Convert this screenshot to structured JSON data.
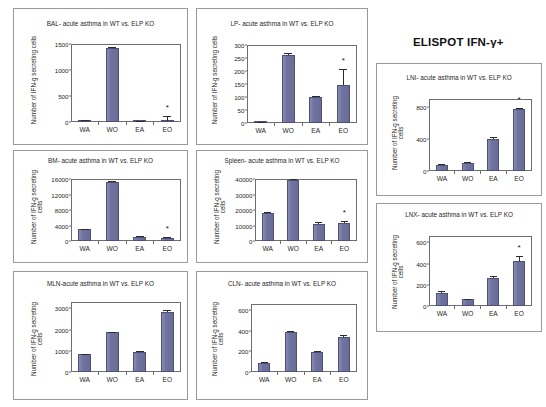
{
  "figure": {
    "main_title": "ELISPOT IFN-γ+",
    "background_color": "#ffffff",
    "bar_color": "#6f739f",
    "bar_edge_color": "#4d5178",
    "significance_marker": "*"
  },
  "chart_data": [
    {
      "id": "bal",
      "type": "bar",
      "title": "BAL- acute asthma in WT vs. ELP KO",
      "ylabel": "Number of IFN-g secreting cells",
      "xlabel": "",
      "categories": [
        "WA",
        "WO",
        "EA",
        "EO"
      ],
      "values": [
        35,
        1420,
        15,
        25
      ],
      "errors": [
        12,
        18,
        6,
        95
      ],
      "ylim": [
        0,
        1500
      ],
      "yticks": [
        0,
        500,
        1000,
        1500
      ],
      "ytick_labels": [
        "0",
        "500",
        "1000",
        "1500"
      ],
      "significance": [
        false,
        false,
        false,
        true
      ],
      "grid": false,
      "legend": "none"
    },
    {
      "id": "lp",
      "type": "bar",
      "title": "LP- acute asthma in WT vs. ELP KO",
      "ylabel": "Number of IFN-g secreting cells",
      "xlabel": "",
      "categories": [
        "WA",
        "WO",
        "EA",
        "EO"
      ],
      "values": [
        3,
        262,
        100,
        148
      ],
      "errors": [
        2,
        6,
        3,
        58
      ],
      "ylim": [
        0,
        300
      ],
      "yticks": [
        0,
        50,
        100,
        150,
        200,
        250,
        300
      ],
      "ytick_labels": [
        "0",
        "50",
        "100",
        "150",
        "200",
        "250",
        "300"
      ],
      "significance": [
        false,
        false,
        false,
        true
      ],
      "grid": false,
      "legend": "none"
    },
    {
      "id": "lni",
      "type": "bar",
      "title": "LNI- acute asthma in WT vs. ELP KO",
      "ylabel": "Number of IFN-g secreting cells",
      "xlabel": "",
      "categories": [
        "WA",
        "WO",
        "EA",
        "EO"
      ],
      "values": [
        75,
        105,
        405,
        775
      ],
      "errors": [
        8,
        8,
        18,
        16
      ],
      "ylim": [
        0,
        900
      ],
      "yticks": [
        0,
        400,
        800
      ],
      "ytick_labels": [
        "0",
        "400",
        "800"
      ],
      "significance": [
        false,
        false,
        false,
        true
      ],
      "grid": false,
      "legend": "none"
    },
    {
      "id": "bm",
      "type": "bar",
      "title": "BM- acute asthma in WT vs. ELP KO",
      "ylabel": "Number of IFN-g secreting cells",
      "xlabel": "",
      "categories": [
        "WA",
        "WO",
        "EA",
        "EO"
      ],
      "values": [
        3050,
        15300,
        1150,
        850
      ],
      "errors": [
        90,
        120,
        220,
        260
      ],
      "ylim": [
        0,
        16000
      ],
      "yticks": [
        0,
        4000,
        8000,
        12000,
        16000
      ],
      "ytick_labels": [
        "0",
        "4000",
        "8000",
        "12000",
        "16000"
      ],
      "significance": [
        false,
        false,
        false,
        true
      ],
      "grid": false,
      "legend": "none"
    },
    {
      "id": "spleen",
      "type": "bar",
      "title": "Spleen- acute asthma in WT vs. ELP KO",
      "ylabel": "Number of IFN-g secreting cells",
      "xlabel": "",
      "categories": [
        "WA",
        "WO",
        "EA",
        "EO"
      ],
      "values": [
        18300,
        39600,
        11200,
        11400
      ],
      "errors": [
        400,
        250,
        1300,
        1600
      ],
      "ylim": [
        0,
        40000
      ],
      "yticks": [
        0,
        10000,
        20000,
        30000,
        40000
      ],
      "ytick_labels": [
        "0",
        "10000",
        "20000",
        "30000",
        "40000"
      ],
      "significance": [
        false,
        false,
        false,
        true
      ],
      "grid": false,
      "legend": "none"
    },
    {
      "id": "lnx",
      "type": "bar",
      "title": "LNX- acute asthma in WT vs. ELP KO",
      "ylabel": "Number of IFN-g secreting cells",
      "xlabel": "",
      "categories": [
        "WA",
        "WO",
        "EA",
        "EO"
      ],
      "values": [
        120,
        62,
        265,
        425
      ],
      "errors": [
        20,
        6,
        15,
        45
      ],
      "ylim": [
        0,
        660
      ],
      "yticks": [
        0,
        200,
        400,
        600
      ],
      "ytick_labels": [
        "0",
        "200",
        "400",
        "600"
      ],
      "significance": [
        false,
        false,
        false,
        true
      ],
      "grid": false,
      "legend": "none"
    },
    {
      "id": "mln",
      "type": "bar",
      "title": "MLN-acute asthma in WT vs. ELP KO",
      "ylabel": "Number of IFN-g secreting cells",
      "xlabel": "",
      "categories": [
        "WA",
        "WO",
        "EA",
        "EO"
      ],
      "values": [
        850,
        1870,
        960,
        2850
      ],
      "errors": [
        10,
        12,
        20,
        95
      ],
      "ylim": [
        0,
        3300
      ],
      "yticks": [
        0,
        1000,
        2000,
        3000
      ],
      "ytick_labels": [
        "0",
        "1000",
        "2000",
        "3000"
      ],
      "significance": [
        false,
        false,
        false,
        false
      ],
      "grid": false,
      "legend": "none"
    },
    {
      "id": "cln",
      "type": "bar",
      "title": "CLN- acute asthma in WT vs. ELP KO",
      "ylabel": "Number of IFN-g secreting cells",
      "xlabel": "",
      "categories": [
        "WA",
        "WO",
        "EA",
        "EO"
      ],
      "values": [
        85,
        390,
        190,
        340
      ],
      "errors": [
        8,
        8,
        18,
        22
      ],
      "ylim": [
        0,
        660
      ],
      "yticks": [
        0,
        200,
        400,
        600
      ],
      "ytick_labels": [
        "0",
        "200",
        "400",
        "600"
      ],
      "significance": [
        false,
        false,
        false,
        false
      ],
      "grid": false,
      "legend": "none"
    }
  ],
  "layout": {
    "panels": [
      {
        "id": "bal",
        "x": 13,
        "y": 8,
        "w": 175,
        "h": 137,
        "plot_x": 57,
        "plot_y": 35,
        "plot_w": 110,
        "plot_h": 78,
        "title_y": 11,
        "ylab_x": 16,
        "ylab_y": 130,
        "ylab_len": 118,
        "two_line": false
      },
      {
        "id": "lp",
        "x": 196,
        "y": 8,
        "w": 172,
        "h": 137,
        "plot_x": 50,
        "plot_y": 36,
        "plot_w": 110,
        "plot_h": 78,
        "title_y": 11,
        "ylab_x": 14,
        "ylab_y": 130,
        "ylab_len": 118,
        "two_line": false
      },
      {
        "id": "lni",
        "x": 376,
        "y": 63,
        "w": 166,
        "h": 133,
        "plot_x": 52,
        "plot_y": 35,
        "plot_w": 103,
        "plot_h": 72,
        "title_y": 10,
        "ylab_x": 14,
        "ylab_y": 122,
        "ylab_len": 106,
        "two_line": true
      },
      {
        "id": "bm",
        "x": 13,
        "y": 150,
        "w": 175,
        "h": 113,
        "plot_x": 57,
        "plot_y": 28,
        "plot_w": 110,
        "plot_h": 62,
        "title_y": 6,
        "ylab_x": 16,
        "ylab_y": 104,
        "ylab_len": 96,
        "two_line": true
      },
      {
        "id": "spleen",
        "x": 196,
        "y": 150,
        "w": 172,
        "h": 113,
        "plot_x": 58,
        "plot_y": 28,
        "plot_w": 102,
        "plot_h": 62,
        "title_y": 6,
        "ylab_x": 16,
        "ylab_y": 104,
        "ylab_len": 96,
        "two_line": true
      },
      {
        "id": "lnx",
        "x": 376,
        "y": 203,
        "w": 166,
        "h": 129,
        "plot_x": 52,
        "plot_y": 32,
        "plot_w": 103,
        "plot_h": 70,
        "title_y": 7,
        "ylab_x": 14,
        "ylab_y": 120,
        "ylab_len": 104,
        "two_line": true
      },
      {
        "id": "mln",
        "x": 13,
        "y": 271,
        "w": 175,
        "h": 129,
        "plot_x": 57,
        "plot_y": 30,
        "plot_w": 110,
        "plot_h": 70,
        "title_y": 8,
        "ylab_x": 16,
        "ylab_y": 120,
        "ylab_len": 106,
        "two_line": true
      },
      {
        "id": "cln",
        "x": 196,
        "y": 271,
        "w": 172,
        "h": 129,
        "plot_x": 54,
        "plot_y": 32,
        "plot_w": 106,
        "plot_h": 68,
        "title_y": 8,
        "ylab_x": 14,
        "ylab_y": 120,
        "ylab_len": 106,
        "two_line": true
      }
    ],
    "main_title_pos": {
      "x": 413,
      "y": 36
    }
  }
}
